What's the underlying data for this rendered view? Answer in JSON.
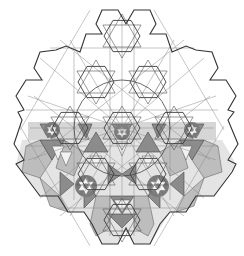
{
  "diagram": {
    "title": "",
    "colors": {
      "background": "#ffffff",
      "outline": "#333333",
      "construction_line": "#8a8a8a",
      "shade_light": "#f2f2f2",
      "shade_mid": "#bdbdbd",
      "shade_band": "#d6d6d6",
      "shade_dark": "#8c8c8c"
    },
    "center": [
      122,
      128
    ],
    "outline_points": "102,10 118,10 126,24 134,10 150,10 156,24 150,34 166,34 172,52 186,46 196,50 212,52 218,68 210,80 226,80 236,96 228,110 234,112 228,120 238,144 228,160 236,164 232,172 214,196 196,196 186,212 170,212 160,224 150,244 134,244 126,228 118,244 102,244 92,224 84,212 68,212 58,196 40,196 22,172 16,164 24,160 14,144 22,120 18,112 24,110 16,96 26,80 42,80 34,68 40,52 56,50 66,46 80,52 86,34 102,34 96,24",
    "construction_lines": [
      [
        122,
        128,
        122,
        20
      ],
      [
        122,
        128,
        122,
        236
      ],
      [
        30,
        128,
        214,
        128
      ],
      [
        122,
        128,
        40,
        58
      ],
      [
        122,
        128,
        204,
        58
      ],
      [
        122,
        128,
        40,
        198
      ],
      [
        122,
        128,
        204,
        198
      ],
      [
        122,
        128,
        70,
        40
      ],
      [
        122,
        128,
        174,
        40
      ],
      [
        122,
        128,
        70,
        216
      ],
      [
        122,
        128,
        174,
        216
      ],
      [
        122,
        128,
        28,
        96
      ],
      [
        122,
        128,
        216,
        96
      ],
      [
        122,
        128,
        28,
        160
      ],
      [
        122,
        128,
        216,
        160
      ],
      [
        26,
        110,
        218,
        110
      ],
      [
        26,
        146,
        218,
        146
      ],
      [
        50,
        48,
        194,
        48
      ],
      [
        58,
        208,
        186,
        208
      ],
      [
        110,
        24,
        110,
        236
      ],
      [
        134,
        24,
        134,
        236
      ],
      [
        74,
        52,
        74,
        200
      ],
      [
        170,
        52,
        170,
        200
      ],
      [
        60,
        40,
        210,
        160
      ],
      [
        184,
        40,
        34,
        160
      ],
      [
        60,
        216,
        210,
        96
      ],
      [
        184,
        216,
        34,
        96
      ],
      [
        90,
        10,
        20,
        130
      ],
      [
        154,
        10,
        224,
        130
      ],
      [
        90,
        246,
        20,
        126
      ],
      [
        154,
        246,
        224,
        126
      ]
    ],
    "circle": {
      "cx": 122,
      "cy": 128,
      "r": 48
    },
    "star_centers": [
      [
        122,
        128
      ],
      [
        70,
        128
      ],
      [
        174,
        128
      ],
      [
        96,
        174
      ],
      [
        148,
        174
      ],
      [
        96,
        82
      ],
      [
        148,
        82
      ],
      [
        122,
        220
      ],
      [
        122,
        36
      ]
    ],
    "band": {
      "x": 28,
      "y": 122,
      "w": 188,
      "h": 18
    },
    "dark_triangles": [
      "40,124 56,124 48,138",
      "78,124 92,124 86,138",
      "112,124 132,124 122,140",
      "152,124 166,124 158,138",
      "188,124 204,124 196,138",
      "40,140 52,160 64,140",
      "180,140 192,160 204,140",
      "96,132 108,152 84,152",
      "148,132 160,152 136,152",
      "108,164 122,174 108,184",
      "136,164 122,174 136,184",
      "60,172 74,184 60,196",
      "184,172 170,184 184,196",
      "84,182 96,196 84,208",
      "160,182 148,196 160,208",
      "110,196 122,214 134,196",
      "108,214 122,228 136,214"
    ],
    "mid_shapes": [
      "26,146 40,140 52,160 40,178 22,172",
      "218,146 204,140 192,160 204,178 222,172",
      "64,140 84,152 74,176 56,168",
      "180,140 160,152 170,176 188,168",
      "96,196 110,196 110,228 96,236 90,224",
      "148,196 134,196 134,228 148,236 154,224",
      "40,178 60,196 68,212 50,206",
      "204,178 184,196 176,212 194,206"
    ],
    "light_shapes": [
      "52,146 64,146 58,160",
      "180,146 192,146 186,160",
      "116,142 128,142 122,156",
      "90,156 102,156 96,168",
      "142,156 154,156 148,168",
      "114,200 130,200 122,212",
      "60,152 72,152 66,166"
    ],
    "small_stars": [
      {
        "cx": 86,
        "cy": 186,
        "r": 9
      },
      {
        "cx": 158,
        "cy": 186,
        "r": 9
      },
      {
        "cx": 52,
        "cy": 130,
        "r": 6
      },
      {
        "cx": 122,
        "cy": 132,
        "r": 6
      },
      {
        "cx": 192,
        "cy": 130,
        "r": 6
      }
    ]
  }
}
